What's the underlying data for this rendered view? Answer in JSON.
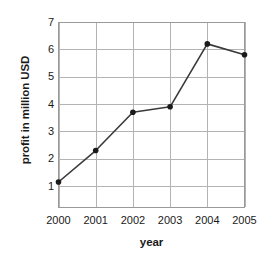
{
  "chart_data": {
    "type": "line",
    "title": "",
    "xlabel": "year",
    "ylabel": "profit in million USD",
    "categories": [
      "2000",
      "2001",
      "2002",
      "2003",
      "2004",
      "2005"
    ],
    "x": [
      2000,
      2001,
      2002,
      2003,
      2004,
      2005
    ],
    "values": [
      1.15,
      2.3,
      3.7,
      3.9,
      6.2,
      5.8
    ],
    "series": [
      {
        "name": "profit",
        "values": [
          1.15,
          2.3,
          3.7,
          3.9,
          6.2,
          5.8
        ]
      }
    ],
    "ylim": [
      0.2,
      7
    ],
    "xlim": [
      2000,
      2005
    ],
    "yticks": [
      1,
      2,
      3,
      4,
      5,
      6,
      7
    ],
    "ytick_labels": [
      "1",
      "2",
      "3",
      "4",
      "5",
      "6",
      "7"
    ],
    "xtick_labels": [
      "2000",
      "2001",
      "2002",
      "2003",
      "2004",
      "2005"
    ],
    "grid": true,
    "grid_axes": "both",
    "legend": false,
    "legend_position": "none",
    "marker": "circle",
    "colors": {
      "line": "#3a3a3a",
      "marker": "#1a1a1a",
      "grid": "#b3b3b3",
      "axis_frame": "#9a9a9a",
      "text": "#1a1a1a",
      "background": "#ffffff"
    }
  }
}
